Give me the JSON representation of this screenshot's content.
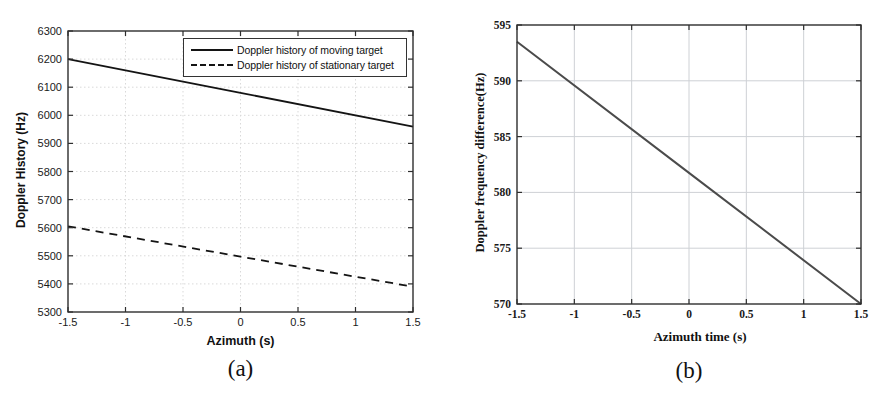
{
  "page": {
    "background_color": "#ffffff"
  },
  "chart_data": [
    {
      "type": "line",
      "caption": "(a)",
      "title": "",
      "xlabel": "Azimuth (s)",
      "ylabel": "Doppler History (Hz)",
      "xlim": [
        -1.5,
        1.5
      ],
      "ylim": [
        5300,
        6300
      ],
      "xticks": [
        -1.5,
        -1,
        -0.5,
        0,
        0.5,
        1,
        1.5
      ],
      "yticks": [
        5300,
        5400,
        5500,
        5600,
        5700,
        5800,
        5900,
        6000,
        6100,
        6200,
        6300
      ],
      "grid": true,
      "legend_position": "top-right-inside",
      "series": [
        {
          "name": "Doppler history of moving target",
          "line_style": "solid",
          "color": "#141414",
          "x": [
            -1.5,
            0,
            1.5
          ],
          "y": [
            6200,
            6080,
            5960
          ]
        },
        {
          "name": "Doppler history of stationary target",
          "line_style": "dashed",
          "color": "#141414",
          "x": [
            -1.5,
            0,
            1.5
          ],
          "y": [
            5605,
            5497,
            5390
          ]
        }
      ]
    },
    {
      "type": "line",
      "caption": "(b)",
      "title": "",
      "xlabel": "Azimuth time (s)",
      "ylabel": "Doppler frequency difference(Hz)",
      "xlim": [
        -1.5,
        1.5
      ],
      "ylim": [
        570,
        595
      ],
      "xticks": [
        -1.5,
        -1,
        -0.5,
        0,
        0.5,
        1,
        1.5
      ],
      "yticks": [
        570,
        575,
        580,
        585,
        590,
        595
      ],
      "grid": true,
      "legend_position": "none",
      "series": [
        {
          "name": "Doppler frequency difference",
          "line_style": "solid",
          "color": "#4b4b4b",
          "x": [
            -1.5,
            0,
            1.5
          ],
          "y": [
            593.5,
            581.75,
            570
          ]
        }
      ]
    }
  ]
}
